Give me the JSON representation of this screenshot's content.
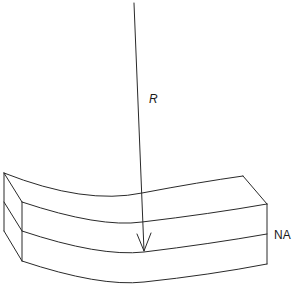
{
  "diagram": {
    "type": "bent-beam",
    "labels": {
      "radius": "R",
      "neutral_axis": "NA"
    },
    "colors": {
      "line": "#2a2a2a",
      "background": "#ffffff"
    }
  }
}
